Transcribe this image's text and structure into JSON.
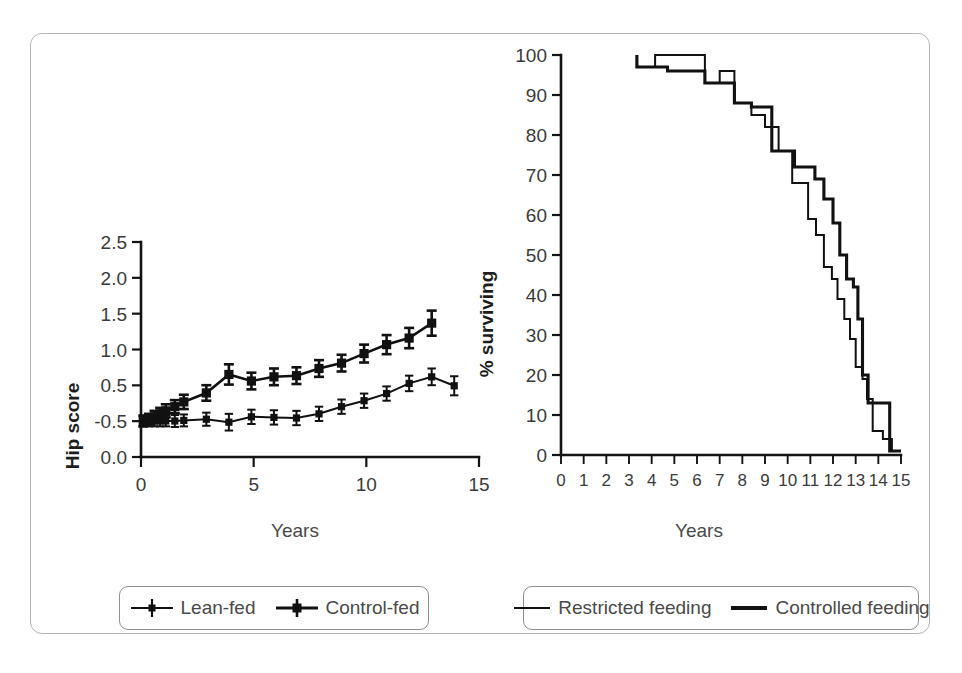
{
  "figure": {
    "panels": [
      "hip-score",
      "survival"
    ],
    "line_color": "#111111",
    "frame_color": "#b5b5b5"
  },
  "chart_data": [
    {
      "type": "line",
      "id": "hip-score",
      "title": "",
      "xlabel": "Years",
      "ylabel": "Hip score",
      "xlim": [
        0,
        15
      ],
      "ylim": [
        -0.6,
        2.5
      ],
      "xticks": [
        0,
        5,
        10,
        15
      ],
      "xtick_labels": [
        "0",
        "5",
        "10",
        "15"
      ],
      "ytick_positions": [
        2.5,
        2.0,
        1.5,
        1.0,
        0.5,
        -0.5,
        0.0
      ],
      "ytick_labels": [
        "2.5",
        "2.0",
        "1.5",
        "1.0",
        "0.5",
        "-0.5",
        "0.0"
      ],
      "grid": false,
      "legend_position": "below",
      "note": "y tick labels reproduce the original figure exactly, including the 0.0 printed below -0.5",
      "series": [
        {
          "name": "Lean-fed",
          "marker": "square-errorbar",
          "x": [
            0.1,
            0.35,
            0.6,
            0.85,
            1.1,
            1.5,
            1.9,
            2.9,
            3.9,
            4.9,
            5.9,
            6.9,
            7.9,
            8.9,
            9.9,
            10.9,
            11.9,
            12.9,
            13.9
          ],
          "y": [
            -0.5,
            -0.5,
            -0.5,
            -0.5,
            -0.5,
            -0.5,
            -0.49,
            -0.47,
            -0.52,
            -0.43,
            -0.44,
            -0.45,
            -0.38,
            -0.26,
            -0.16,
            -0.04,
            0.13,
            0.24,
            0.09
          ],
          "yerr": [
            0.09,
            0.09,
            0.09,
            0.09,
            0.09,
            0.1,
            0.1,
            0.11,
            0.14,
            0.12,
            0.12,
            0.12,
            0.12,
            0.12,
            0.12,
            0.12,
            0.13,
            0.14,
            0.16
          ]
        },
        {
          "name": "Control-fed",
          "marker": "square-errorbar",
          "x": [
            0.1,
            0.35,
            0.6,
            0.85,
            1.1,
            1.5,
            1.9,
            2.9,
            3.9,
            4.9,
            5.9,
            6.9,
            7.9,
            8.9,
            9.9,
            10.9,
            11.9,
            12.9
          ],
          "y": [
            -0.5,
            -0.47,
            -0.43,
            -0.38,
            -0.33,
            -0.26,
            -0.18,
            -0.03,
            0.28,
            0.17,
            0.24,
            0.26,
            0.38,
            0.47,
            0.63,
            0.78,
            0.89,
            1.14
          ],
          "yerr": [
            0.09,
            0.09,
            0.1,
            0.1,
            0.11,
            0.11,
            0.12,
            0.13,
            0.17,
            0.14,
            0.14,
            0.14,
            0.14,
            0.14,
            0.15,
            0.16,
            0.17,
            0.21
          ]
        }
      ]
    },
    {
      "type": "line",
      "id": "survival",
      "title": "",
      "xlabel": "Years",
      "ylabel": "% surviving",
      "xlim": [
        0,
        15
      ],
      "ylim": [
        0,
        100
      ],
      "xticks": [
        0,
        1,
        2,
        3,
        4,
        5,
        6,
        7,
        8,
        9,
        10,
        11,
        12,
        13,
        14,
        15
      ],
      "xtick_labels": [
        "0",
        "1",
        "2",
        "3",
        "4",
        "5",
        "6",
        "7",
        "8",
        "9",
        "10",
        "11",
        "12",
        "13",
        "14",
        "15"
      ],
      "yticks": [
        0,
        10,
        20,
        30,
        40,
        50,
        60,
        70,
        80,
        90,
        100
      ],
      "ytick_labels": [
        "0",
        "10",
        "20",
        "30",
        "40",
        "50",
        "60",
        "70",
        "80",
        "90",
        "100"
      ],
      "grid": false,
      "legend_position": "below",
      "step": "post",
      "series": [
        {
          "name": "Restricted feeding",
          "stroke": "thin",
          "x": [
            3.35,
            3.35,
            3.6,
            4.15,
            4.15,
            6.35,
            6.35,
            7.0,
            7.0,
            7.65,
            7.65,
            8.4,
            8.4,
            9.0,
            9.0,
            9.6,
            9.6,
            10.2,
            10.2,
            10.9,
            10.9,
            11.25,
            11.25,
            11.6,
            11.6,
            11.95,
            11.95,
            12.2,
            12.2,
            12.5,
            12.5,
            12.75,
            12.75,
            13.0,
            13.0,
            13.3,
            13.3,
            13.5,
            13.5,
            13.75,
            13.75,
            14.2,
            14.2,
            14.6,
            14.6,
            15.0
          ],
          "y": [
            100,
            97,
            97,
            97,
            100,
            100,
            93,
            93,
            96,
            96,
            88,
            88,
            85,
            85,
            82,
            82,
            76,
            76,
            68,
            68,
            59,
            59,
            55,
            55,
            47,
            47,
            44,
            44,
            39,
            39,
            34,
            34,
            29,
            29,
            22,
            22,
            19,
            19,
            14,
            14,
            6,
            6,
            4,
            4,
            1,
            1
          ]
        },
        {
          "name": "Controlled feeding",
          "stroke": "thick",
          "x": [
            3.35,
            3.35,
            4.7,
            4.7,
            6.35,
            6.35,
            7.65,
            7.65,
            8.4,
            8.4,
            9.3,
            9.3,
            10.3,
            10.3,
            11.2,
            11.2,
            11.6,
            11.6,
            12.0,
            12.0,
            12.3,
            12.3,
            12.6,
            12.6,
            12.9,
            12.9,
            13.1,
            13.1,
            13.3,
            13.3,
            13.55,
            13.55,
            14.5,
            14.5,
            15.0
          ],
          "y": [
            100,
            97,
            97,
            96,
            96,
            93,
            93,
            88,
            88,
            87,
            87,
            76,
            76,
            72,
            72,
            69,
            69,
            64,
            64,
            58,
            58,
            50,
            50,
            44,
            44,
            42,
            42,
            34,
            34,
            20,
            20,
            13,
            13,
            1,
            1
          ]
        }
      ]
    }
  ],
  "left_panel": {
    "y_axis_label": "Hip score",
    "x_axis_label": "Years",
    "legend": [
      {
        "label": "Lean-fed",
        "style": "errorbar-marker"
      },
      {
        "label": "Control-fed",
        "style": "errorbar-marker"
      }
    ]
  },
  "right_panel": {
    "y_axis_label": "% surviving",
    "x_axis_label": "Years",
    "legend": [
      {
        "label": "Restricted feeding",
        "style": "thin-line"
      },
      {
        "label": "Controlled feeding",
        "style": "thick-line"
      }
    ]
  }
}
